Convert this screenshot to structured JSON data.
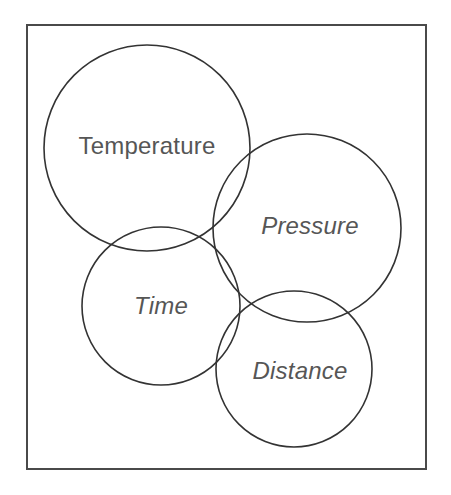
{
  "figure": {
    "type": "venn-diagram",
    "title": "",
    "background_color": "#ffffff",
    "frame": {
      "label": "diagram-border",
      "x": 27,
      "y": 25,
      "width": 399,
      "height": 444,
      "stroke_color": "#4a4a4a",
      "stroke_width": 2
    },
    "stroke_color": "#333333",
    "label_color": "#565656"
  },
  "sets": [
    {
      "id": "temperature",
      "label": "Temperature",
      "cx": 147,
      "cy": 148,
      "r": 103,
      "label_x": 147,
      "label_y": 148,
      "font_style": "normal"
    },
    {
      "id": "pressure",
      "label": "Pressure",
      "cx": 307,
      "cy": 228,
      "r": 94,
      "label_x": 310,
      "label_y": 228,
      "font_style": "italic"
    },
    {
      "id": "time",
      "label": "Time",
      "cx": 161,
      "cy": 306,
      "r": 79,
      "label_x": 161,
      "label_y": 308,
      "font_style": "italic"
    },
    {
      "id": "distance",
      "label": "Distance",
      "cx": 294,
      "cy": 369,
      "r": 78,
      "label_x": 300,
      "label_y": 373,
      "font_style": "italic"
    }
  ],
  "overlaps": [
    {
      "a": "temperature",
      "b": "pressure"
    },
    {
      "a": "temperature",
      "b": "time"
    },
    {
      "a": "pressure",
      "b": "time"
    },
    {
      "a": "pressure",
      "b": "distance"
    },
    {
      "a": "time",
      "b": "distance"
    }
  ]
}
